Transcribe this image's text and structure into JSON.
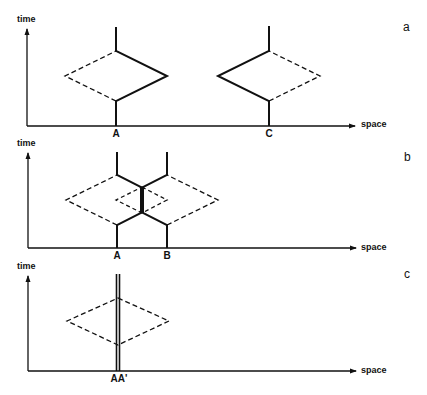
{
  "figure": {
    "panels": [
      {
        "id": "a",
        "panel_label": "a",
        "y_axis_label": "time",
        "x_axis_label": "space",
        "points": [
          {
            "label": "A",
            "x": 116
          },
          {
            "label": "C",
            "x": 269
          }
        ]
      },
      {
        "id": "b",
        "panel_label": "b",
        "y_axis_label": "time",
        "x_axis_label": "space",
        "points": [
          {
            "label": "A",
            "x": 117
          },
          {
            "label": "B",
            "x": 167
          }
        ]
      },
      {
        "id": "c",
        "panel_label": "c",
        "y_axis_label": "time",
        "x_axis_label": "space",
        "points": [
          {
            "label": "AA'",
            "x": 118
          }
        ]
      }
    ],
    "colors": {
      "ink": "#111111",
      "background": "#ffffff"
    }
  }
}
